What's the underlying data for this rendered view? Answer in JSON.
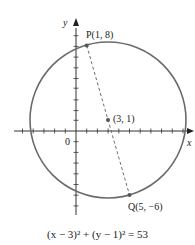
{
  "diagram": {
    "type": "circle-on-coordinate-plane",
    "axes": {
      "x_label": "x",
      "y_label": "y",
      "origin_label": "0"
    },
    "center": {
      "x": 3,
      "y": 1,
      "label": "(3, 1)"
    },
    "point_p": {
      "name": "P",
      "x": 1,
      "y": 8,
      "label": "P(1, 8)"
    },
    "point_q": {
      "name": "Q",
      "x": 5,
      "y": -6,
      "label": "Q(5, −6)"
    },
    "radius_squared": 53,
    "equation": "(x − 3)² + (y − 1)² = 53",
    "colors": {
      "circle": "#666666",
      "axes": "#333333",
      "diameter": "#666666"
    }
  }
}
